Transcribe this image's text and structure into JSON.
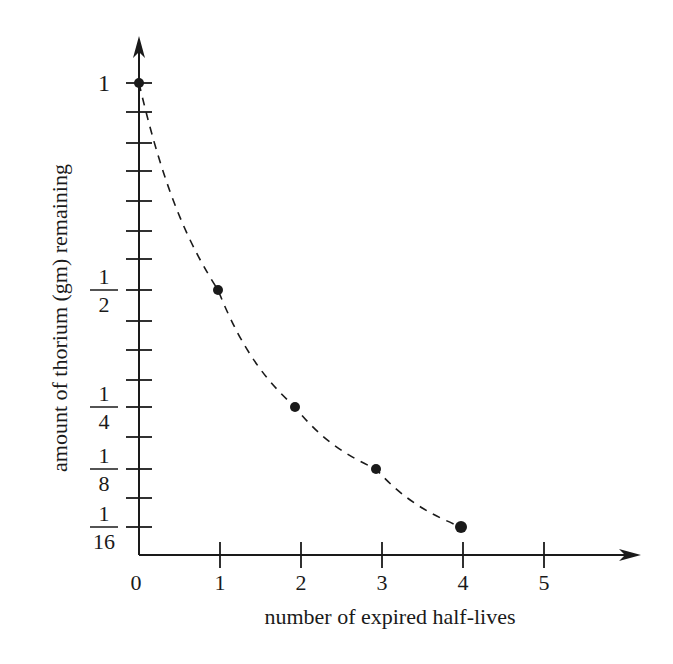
{
  "chart_data": {
    "type": "scatter",
    "title": "",
    "xlabel": "number of expired half-lives",
    "ylabel": "amount of thorium (gm) remaining",
    "x": [
      0,
      1,
      2,
      3,
      4
    ],
    "series": [
      {
        "name": "thorium remaining",
        "values": [
          1,
          0.5,
          0.25,
          0.125,
          0.0625
        ],
        "line_style": "dashed",
        "marker": "filled-circle"
      }
    ],
    "x_ticks": [
      "0",
      "1",
      "2",
      "3",
      "4",
      "5"
    ],
    "y_tick_labels": [
      {
        "value": 1,
        "num": "1",
        "den": ""
      },
      {
        "value": 0.5,
        "num": "1",
        "den": "2"
      },
      {
        "value": 0.25,
        "num": "1",
        "den": "4"
      },
      {
        "value": 0.125,
        "num": "1",
        "den": "8"
      },
      {
        "value": 0.0625,
        "num": "1",
        "den": "16"
      }
    ],
    "xlim": [
      0,
      5.8
    ],
    "ylim": [
      0,
      1.1
    ],
    "grid": false,
    "legend": "none"
  },
  "colors": {
    "ink": "#1a1a1a",
    "background": "#ffffff"
  }
}
